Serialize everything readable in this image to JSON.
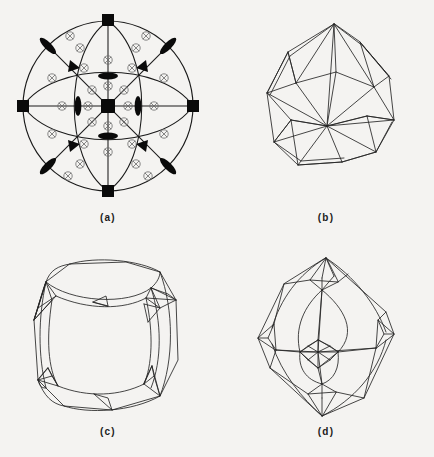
{
  "figure": {
    "kind": "crystallography-figure-panel",
    "background_color": "#f4f3f1",
    "ink_color": "#1a1a1a",
    "panel_count": 4,
    "panels": [
      {
        "id": "a",
        "caption": "(a)",
        "type": "stereogram",
        "description": "Stereographic projection of point group m-3m symmetry elements",
        "circle": {
          "cx": 100,
          "cy": 104,
          "r": 85
        },
        "symmetry_markers": [
          {
            "name": "four-fold-axis",
            "glyph": "filled-square",
            "count": 5,
            "positions": [
              [
                100,
                104
              ],
              [
                100,
                19
              ],
              [
                100,
                189
              ],
              [
                15,
                104
              ],
              [
                185,
                104
              ]
            ]
          },
          {
            "name": "three-fold-axis",
            "glyph": "filled-triangle",
            "count": 4,
            "positions": [
              [
                60,
                64
              ],
              [
                140,
                64
              ],
              [
                60,
                144
              ],
              [
                140,
                144
              ]
            ]
          },
          {
            "name": "two-fold-axis",
            "glyph": "filled-lens",
            "count": 12,
            "positions": [
              [
                100,
                64
              ],
              [
                100,
                144
              ],
              [
                60,
                104
              ],
              [
                140,
                104
              ],
              [
                40,
                44
              ],
              [
                160,
                44
              ],
              [
                40,
                164
              ],
              [
                160,
                164
              ],
              [
                40,
                44
              ],
              [
                160,
                44
              ],
              [
                40,
                164
              ],
              [
                160,
                164
              ]
            ]
          },
          {
            "name": "inversion-centre",
            "glyph": "circled-cross",
            "count": 28
          }
        ],
        "mirror_traces": {
          "great_circles": 4,
          "straight_traces": 4
        }
      },
      {
        "id": "b",
        "caption": "(b)",
        "type": "polyhedron-wireframe",
        "description": "Triangulated deltoidal polyhedron, oblique view"
      },
      {
        "id": "c",
        "caption": "(c)",
        "type": "polyhedron-wireframe",
        "description": "Rounded cube with triangulated corner clusters"
      },
      {
        "id": "d",
        "caption": "(d)",
        "type": "polyhedron-wireframe",
        "description": "Rounded octahedral form with star-shaped vertex clusters"
      }
    ]
  }
}
